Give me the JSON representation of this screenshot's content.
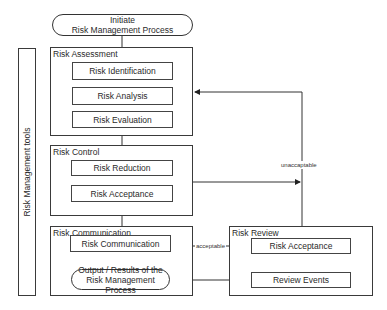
{
  "diagram": {
    "start": {
      "line1": "Initiate",
      "line2": "Risk Management Process"
    },
    "tools_bar": {
      "label": "Risk Management tools"
    },
    "groups": {
      "assessment": {
        "title": "Risk Assessment",
        "steps": [
          "Risk Identification",
          "Risk Analysis",
          "Risk Evaluation"
        ]
      },
      "control": {
        "title": "Risk Control",
        "steps": [
          "Risk Reduction",
          "Risk Acceptance"
        ]
      },
      "communication": {
        "title": "Risk Communication",
        "steps": [
          "Risk Communication"
        ],
        "output": {
          "line1": "Output / Results of the",
          "line2": "Risk Management Process"
        }
      },
      "review": {
        "title": "Risk Review",
        "steps": [
          "Risk Acceptance",
          "Review Events"
        ]
      }
    },
    "edge_labels": {
      "unacceptable": "unaccaptable",
      "acceptable": "acceptable"
    },
    "colors": {
      "line": "#333333",
      "background": "#ffffff",
      "text": "#2a2a2a"
    }
  }
}
